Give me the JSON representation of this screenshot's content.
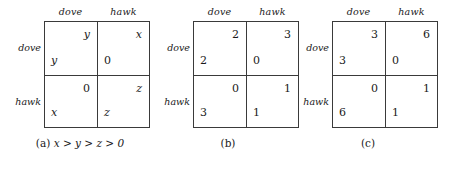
{
  "figure": {
    "type": "payoff-matrix-set",
    "background_color": "#ffffff",
    "line_color": "#3a3a3a",
    "text_color": "#1a1a1a",
    "matrices": [
      {
        "id": "a",
        "column_headers": [
          "dove",
          "hawk"
        ],
        "row_labels": [
          "dove",
          "hawk"
        ],
        "cells": [
          {
            "row": "dove",
            "column": "dove",
            "row_payoff": "y",
            "col_payoff": "y",
            "symbolic": true
          },
          {
            "row": "dove",
            "column": "hawk",
            "row_payoff": "0",
            "col_payoff": "x",
            "symbolic": true
          },
          {
            "row": "hawk",
            "column": "dove",
            "row_payoff": "x",
            "col_payoff": "0",
            "symbolic": true
          },
          {
            "row": "hawk",
            "column": "hawk",
            "row_payoff": "z",
            "col_payoff": "z",
            "symbolic": true
          }
        ],
        "caption": {
          "label": "(a)",
          "expression": "x > y > z > 0",
          "tokens": [
            "x",
            ">",
            "y",
            ">",
            "z",
            ">",
            "0"
          ]
        }
      },
      {
        "id": "b",
        "column_headers": [
          "dove",
          "hawk"
        ],
        "row_labels": [
          "dove",
          "hawk"
        ],
        "cells": [
          {
            "row": "dove",
            "column": "dove",
            "row_payoff": "2",
            "col_payoff": "2",
            "symbolic": false
          },
          {
            "row": "dove",
            "column": "hawk",
            "row_payoff": "0",
            "col_payoff": "3",
            "symbolic": false
          },
          {
            "row": "hawk",
            "column": "dove",
            "row_payoff": "3",
            "col_payoff": "0",
            "symbolic": false
          },
          {
            "row": "hawk",
            "column": "hawk",
            "row_payoff": "1",
            "col_payoff": "1",
            "symbolic": false
          }
        ],
        "caption": {
          "label": "(b)",
          "expression": "",
          "tokens": []
        }
      },
      {
        "id": "c",
        "column_headers": [
          "dove",
          "hawk"
        ],
        "row_labels": [
          "dove",
          "hawk"
        ],
        "cells": [
          {
            "row": "dove",
            "column": "dove",
            "row_payoff": "3",
            "col_payoff": "3",
            "symbolic": false
          },
          {
            "row": "dove",
            "column": "hawk",
            "row_payoff": "0",
            "col_payoff": "6",
            "symbolic": false
          },
          {
            "row": "hawk",
            "column": "dove",
            "row_payoff": "6",
            "col_payoff": "0",
            "symbolic": false
          },
          {
            "row": "hawk",
            "column": "hawk",
            "row_payoff": "1",
            "col_payoff": "1",
            "symbolic": false
          }
        ],
        "caption": {
          "label": "(c)",
          "expression": "",
          "tokens": []
        }
      }
    ]
  }
}
